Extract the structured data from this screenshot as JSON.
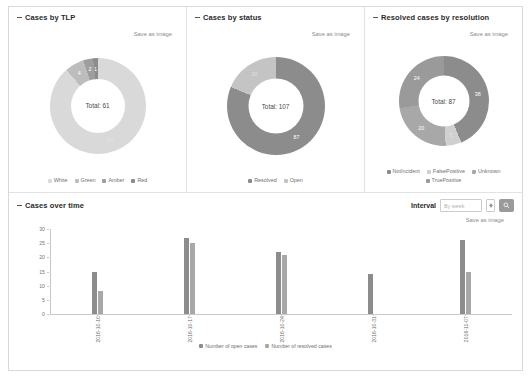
{
  "colors": {
    "white": "#d9d9d9",
    "green": "#bdbdbd",
    "amber": "#9e9e9e",
    "red": "#8c8c8c",
    "resolved": "#8c8c8c",
    "open": "#c4c4c4",
    "notincident": "#8c8c8c",
    "falsepositive": "#d0d0d0",
    "unknown": "#a8a8a8",
    "truepositive": "#9a9a9a",
    "open_bar": "#8c8c8c",
    "resolved_bar": "#a8a8a8",
    "button": "#9a9a9a"
  },
  "panels": {
    "tlp": {
      "title": "Cases by TLP",
      "save_label": "Save as image",
      "center_label": "Total: 61"
    },
    "status": {
      "title": "Cases by status",
      "save_label": "Save as image",
      "center_label": "Total: 107"
    },
    "resolution": {
      "title": "Resolved cases by resolution",
      "save_label": "Save as image",
      "center_label": "Total: 87"
    },
    "overtime": {
      "title": "Cases over time",
      "save_label": "Save as image",
      "interval_label": "Interval",
      "interval_value": "By week",
      "search_icon": "search-icon",
      "spinner_icon": "stepper-icon"
    }
  },
  "chart_data": [
    {
      "type": "pie",
      "title": "Cases by TLP",
      "center_text": "Total: 61",
      "total": 61,
      "legend_position": "bottom",
      "categories": [
        "White",
        "Green",
        "Amber",
        "Red"
      ],
      "values": [
        54,
        4,
        2,
        1
      ],
      "labels": [
        "54",
        "4",
        "2",
        "1"
      ],
      "colors": [
        "#d9d9d9",
        "#bdbdbd",
        "#9e9e9e",
        "#8c8c8c"
      ]
    },
    {
      "type": "pie",
      "title": "Cases by status",
      "center_text": "Total: 107",
      "total": 107,
      "legend_position": "bottom",
      "categories": [
        "Resolved",
        "Open"
      ],
      "values": [
        87,
        20
      ],
      "labels": [
        "87",
        "20"
      ],
      "colors": [
        "#8c8c8c",
        "#c4c4c4"
      ]
    },
    {
      "type": "pie",
      "title": "Resolved cases by resolution",
      "center_text": "Total: 87",
      "total": 87,
      "legend_position": "bottom",
      "categories": [
        "NotIncident",
        "FalsePositive",
        "Unknown",
        "TruePositive"
      ],
      "values": [
        38,
        5,
        20,
        24
      ],
      "labels": [
        "38",
        "5",
        "20",
        "24"
      ],
      "colors": [
        "#8c8c8c",
        "#d0d0d0",
        "#a8a8a8",
        "#9a9a9a"
      ]
    },
    {
      "type": "bar",
      "title": "Cases over time",
      "xlabel": "",
      "ylabel": "",
      "ylim": [
        0,
        30
      ],
      "yticks": [
        0,
        5,
        10,
        15,
        20,
        25,
        30
      ],
      "grid": false,
      "legend_position": "bottom",
      "categories": [
        "2016-10-10",
        "2016-10-17",
        "2016-10-24",
        "2016-10-31",
        "2016-11-07"
      ],
      "series": [
        {
          "name": "Number of open cases",
          "values": [
            15,
            27,
            22,
            14,
            26
          ]
        },
        {
          "name": "Number of resolved cases",
          "values": [
            8,
            25,
            21,
            0,
            15
          ]
        }
      ]
    }
  ]
}
